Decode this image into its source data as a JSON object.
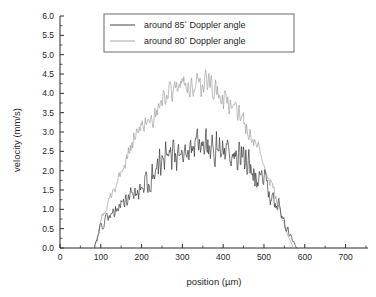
{
  "chart_data": {
    "type": "line",
    "title": "",
    "xlabel": "position (µm)",
    "ylabel": "velocity (mm/s)",
    "xlim": [
      0,
      755
    ],
    "ylim": [
      0.0,
      6.0
    ],
    "grid": false,
    "legend_position": "top-center",
    "x_ticks": [
      0,
      100,
      200,
      300,
      400,
      500,
      600,
      700
    ],
    "x_tick_labels": [
      "0",
      "100",
      "200",
      "300",
      "400",
      "500",
      "600",
      "700"
    ],
    "x_minor_interval": 50,
    "y_ticks": [
      0.0,
      0.5,
      1.0,
      1.5,
      2.0,
      2.5,
      3.0,
      3.5,
      4.0,
      4.5,
      5.0,
      5.5,
      6.0
    ],
    "y_tick_labels": [
      "0.0",
      "0.5",
      "1.0",
      "1.5",
      "2.0",
      "2.5",
      "3.0",
      "3.5",
      "4.0",
      "4.5",
      "5.0",
      "5.5",
      "6.0"
    ],
    "y_minor_interval": 0.25,
    "series": [
      {
        "name": "around 85° Doppler angle",
        "legend_prefix": "around ",
        "legend_angle": "85",
        "legend_degree": "°",
        "legend_suffix": " Doppler angle",
        "color": "#303030",
        "x_start": 85,
        "x_end": 580,
        "peak_value": 3.1,
        "plateau_value": 2.5,
        "noise_amplitude": 0.55,
        "sample_count": 330,
        "noise_seed": 7,
        "description": "Noisy parabolic velocity profile peaking near 2.5-3.1 mm/s between 250 and 420 um"
      },
      {
        "name": "around 80° Doppler angle",
        "legend_prefix": "around ",
        "legend_angle": "80",
        "legend_degree": "°",
        "legend_suffix": " Doppler angle",
        "color": "#9a9a9a",
        "x_start": 85,
        "x_end": 572,
        "peak_value": 4.7,
        "plateau_value": 4.15,
        "noise_amplitude": 0.38,
        "sample_count": 330,
        "noise_seed": 23,
        "description": "Noisy parabolic velocity profile peaking near 4.2-4.7 mm/s between 280 and 400 um"
      }
    ],
    "data_points": {
      "note": "Profiles sampled every ~1.5 um across the vessel cross-section",
      "series_85": {
        "x": [
          85,
          100,
          120,
          140,
          160,
          180,
          200,
          220,
          240,
          260,
          280,
          300,
          320,
          340,
          360,
          380,
          400,
          420,
          440,
          460,
          480,
          500,
          520,
          540,
          560,
          580
        ],
        "y": [
          0.05,
          0.55,
          0.85,
          1.0,
          1.2,
          1.45,
          1.6,
          1.85,
          2.05,
          2.3,
          2.45,
          2.55,
          2.6,
          2.6,
          2.6,
          2.55,
          2.5,
          2.45,
          2.3,
          2.15,
          1.95,
          1.7,
          1.35,
          0.95,
          0.4,
          0.0
        ]
      },
      "series_80": {
        "x": [
          85,
          100,
          120,
          140,
          160,
          180,
          200,
          220,
          240,
          260,
          280,
          300,
          320,
          340,
          360,
          380,
          400,
          420,
          440,
          460,
          480,
          500,
          520,
          540,
          560,
          572
        ],
        "y": [
          0.05,
          0.7,
          1.25,
          1.7,
          2.2,
          2.75,
          3.15,
          3.2,
          3.5,
          3.85,
          4.1,
          4.3,
          4.25,
          4.25,
          4.3,
          4.1,
          3.85,
          3.75,
          3.4,
          3.1,
          2.7,
          2.2,
          1.6,
          0.95,
          0.3,
          0.0
        ]
      }
    }
  },
  "figure": {
    "background_color": "#ffffff",
    "axis_color": "#2b2b2b",
    "legend_border_color": "#5b5b5b"
  }
}
